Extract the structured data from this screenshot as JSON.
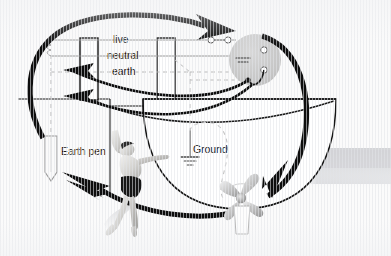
{
  "diagram": {
    "background_color": "#fbfbfb",
    "ink_color": "#111111",
    "wire_color": "#8c8c8c",
    "dashed_color": "#b3b3b3",
    "disc_color": "#c9c9c9",
    "shadow_color": "#d7d8da"
  },
  "labels": {
    "live": "live",
    "neutral": "neutral",
    "earth": "earth",
    "earth_pen": "Earth pen",
    "ground": "Ground"
  },
  "icons": {
    "ground_symbol": "ground-symbol",
    "earth_pen_stake": "earth-pen-stake",
    "propeller": "propeller",
    "shore_power_disc": "shore-power-disc",
    "swimmer": "swimmer",
    "terminal_dot": "terminal-dot"
  },
  "elements": {
    "conductors": [
      {
        "name": "live",
        "y": 40
      },
      {
        "name": "neutral",
        "y": 56
      },
      {
        "name": "earth",
        "y": 72
      }
    ],
    "dock_posts": 2,
    "terminals_on_disc": 2,
    "switch_contacts": 2,
    "current_arrows": 4,
    "arrow_directions": [
      "clockwise-over-top",
      "left-to-earth-pen",
      "down-into-hull",
      "along-waterline-left"
    ]
  }
}
